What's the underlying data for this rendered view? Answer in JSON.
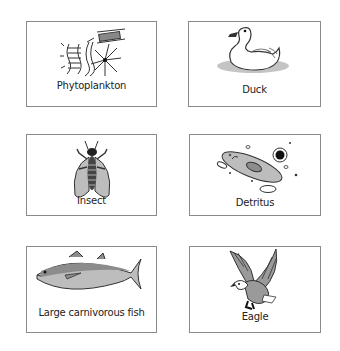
{
  "cards": [
    {
      "id": "phytoplankton",
      "label": "Phytoplankton",
      "icon": "phytoplankton-icon"
    },
    {
      "id": "duck",
      "label": "Duck",
      "icon": "duck-icon"
    },
    {
      "id": "insect",
      "label": "Insect",
      "icon": "insect-icon"
    },
    {
      "id": "detritus",
      "label": "Detritus",
      "icon": "detritus-icon"
    },
    {
      "id": "fish",
      "label": "Large carnivorous fish",
      "icon": "fish-icon"
    },
    {
      "id": "eagle",
      "label": "Eagle",
      "icon": "eagle-icon"
    }
  ],
  "colors": {
    "border": "#8a8a8a",
    "fill_gray": "#b9b9b9",
    "fill_dark": "#8c8c8c",
    "ink": "#222222"
  }
}
